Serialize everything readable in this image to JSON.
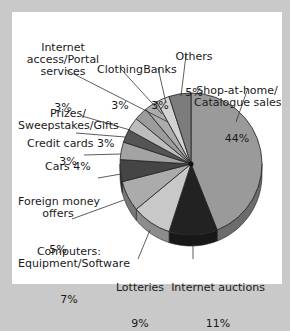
{
  "chart_data": {
    "type": "pie",
    "title": "",
    "start_angle": "12 o'clock, clockwise",
    "categories": [
      "Shop-at-home/ Catalogue sales",
      "Internet auctions",
      "Lotteries",
      "Computers: Equipment/Software",
      "Foreign money offers",
      "Cars",
      "Credit cards",
      "Prizes/ Sweepstakes/Gifts",
      "Internet access/Portal services",
      "Clothing",
      "Banks",
      "Others"
    ],
    "values": [
      44,
      11,
      9,
      7,
      5,
      4,
      3,
      3,
      3,
      3,
      3,
      5
    ],
    "unit": "%",
    "colors": [
      "#9a9a9a",
      "#222222",
      "#c8c8c8",
      "#ababab",
      "#454545",
      "#a3a3a3",
      "#555555",
      "#bdbdbd",
      "#9c9c9c",
      "#acacac",
      "#d2d2d2",
      "#7c7c7c"
    ]
  },
  "labels": {
    "shop": {
      "name": "Shop-at-home/\nCatalogue sales",
      "pct": "44%"
    },
    "auctions": {
      "name": "Internet auctions",
      "pct": "11%"
    },
    "lotteries": {
      "name": "Lotteries",
      "pct": "9%"
    },
    "computers": {
      "name": "Computers:\nEquipment/Software",
      "pct": "7%"
    },
    "foreign": {
      "name": "Foreign money\noffers",
      "pct": "5%"
    },
    "cars": {
      "text": "Cars 4%"
    },
    "credit": {
      "text": "Credit cards 3%"
    },
    "prizes": {
      "name": "Prizes/\nSweepstakes/Gifts",
      "pct": "3%"
    },
    "internet": {
      "name": "Internet\naccess/Portal\nservices",
      "pct": "3%"
    },
    "clothing": {
      "name": "Clothing",
      "pct": "3%"
    },
    "banks": {
      "name": "Banks",
      "pct": "3%"
    },
    "others": {
      "name": "Others",
      "pct": "5%"
    }
  }
}
